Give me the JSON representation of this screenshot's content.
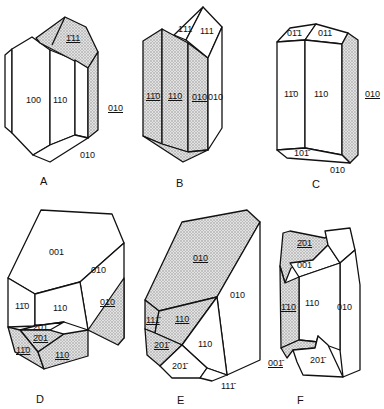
{
  "figure": {
    "panels": [
      {
        "id": "A",
        "caption": "A",
        "faces": [
          {
            "label": "1̄11",
            "underlined": true,
            "shaded": true
          },
          {
            "label": "100"
          },
          {
            "label": "110"
          },
          {
            "label": "010",
            "underlined": true,
            "shaded": true
          },
          {
            "label": "010"
          }
        ]
      },
      {
        "id": "B",
        "caption": "B",
        "faces": [
          {
            "label": "1̄11"
          },
          {
            "label": "111"
          },
          {
            "label": "11̄0",
            "underlined": true,
            "shaded": true
          },
          {
            "label": "110",
            "underlined": true,
            "shaded": true
          },
          {
            "label": "010",
            "underlined": true,
            "shaded": true
          },
          {
            "label": "010"
          }
        ]
      },
      {
        "id": "C",
        "caption": "C",
        "faces": [
          {
            "label": "01̄1"
          },
          {
            "label": "011"
          },
          {
            "label": "11̄0"
          },
          {
            "label": "110"
          },
          {
            "label": "010",
            "underlined": true,
            "shaded": true
          },
          {
            "label": "101̄"
          },
          {
            "label": "010"
          }
        ]
      },
      {
        "id": "D",
        "caption": "D",
        "faces": [
          {
            "label": "001"
          },
          {
            "label": "010"
          },
          {
            "label": "010",
            "underlined": true,
            "shaded": true
          },
          {
            "label": "11̄0"
          },
          {
            "label": "110"
          },
          {
            "label": "2̄01"
          },
          {
            "label": "2̄01",
            "underlined": true,
            "shaded": true
          },
          {
            "label": "11̄0",
            "underlined": true,
            "shaded": true
          },
          {
            "label": "110",
            "underlined": true,
            "shaded": true
          }
        ]
      },
      {
        "id": "E",
        "caption": "E",
        "faces": [
          {
            "label": "010",
            "underlined": true,
            "shaded": true
          },
          {
            "label": "010"
          },
          {
            "label": "111̄",
            "underlined": true,
            "shaded": true
          },
          {
            "label": "110",
            "underlined": true,
            "shaded": true
          },
          {
            "label": "20 1̄",
            "underlined": true,
            "shaded": true
          },
          {
            "label": "110"
          },
          {
            "label": "201̄"
          },
          {
            "label": "111̄"
          }
        ]
      },
      {
        "id": "F",
        "caption": "F",
        "faces": [
          {
            "label": "2̄01",
            "underlined": true,
            "shaded": true
          },
          {
            "label": "001"
          },
          {
            "label": "1̄10",
            "underlined": true,
            "shaded": true
          },
          {
            "label": "110"
          },
          {
            "label": "010"
          },
          {
            "label": "001̄",
            "underlined": true,
            "shaded": true
          },
          {
            "label": "201̄"
          }
        ]
      }
    ]
  },
  "labels": {
    "A": {
      "f111": "1̄11",
      "f100": "100",
      "f110": "110",
      "f010u": "010",
      "f010": "010",
      "cap": "A"
    },
    "B": {
      "f1b11": "1̄11",
      "f111": "111",
      "f1b10": "11̄0",
      "f110": "110",
      "f010u": "010",
      "f010": "010",
      "cap": "B"
    },
    "C": {
      "f01b1": "01̄1",
      "f011": "011",
      "f1b10": "11̄0",
      "f110": "110",
      "f010u": "010",
      "f101b": "101̄",
      "f010": "010",
      "cap": "C"
    },
    "D": {
      "f001": "001",
      "f010": "010",
      "f010u": "010",
      "f1b10": "11̄0",
      "f110": "110",
      "f2b01": "2̄01",
      "f2b01u": "2̄01",
      "f1b10u": "11̄0",
      "f110u": "110",
      "cap": "D"
    },
    "E": {
      "f010u": "010",
      "f010": "010",
      "f111bu": "111̄",
      "f110u": "110",
      "f201bu": "201̄",
      "f110": "110",
      "f201b": "201̄",
      "f111b": "111̄",
      "cap": "E"
    },
    "F": {
      "f2b01u": "2̄01",
      "f001": "001",
      "f1b10u": "1̄10",
      "f110": "110",
      "f010": "010",
      "f001bu": "001̄",
      "f201b": "201̄",
      "cap": "F"
    }
  }
}
